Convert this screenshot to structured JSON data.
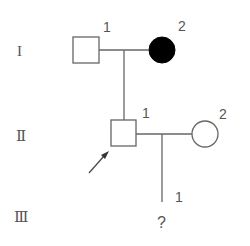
{
  "diagram": {
    "type": "pedigree-chart",
    "colors": {
      "line": "#666666",
      "affected_fill": "#000000",
      "unaffected_fill": "#ffffff",
      "text": "#555555"
    },
    "generations": [
      {
        "label": "I",
        "y": 50
      },
      {
        "label": "Ⅱ",
        "y": 135
      },
      {
        "label": "Ⅲ",
        "y": 216
      }
    ],
    "individuals": [
      {
        "id": "I-1",
        "generation": "I",
        "number": "1",
        "sex": "male",
        "affected": false
      },
      {
        "id": "I-2",
        "generation": "I",
        "number": "2",
        "sex": "female",
        "affected": true
      },
      {
        "id": "II-1",
        "generation": "II",
        "number": "1",
        "sex": "male",
        "affected": false,
        "proband": true
      },
      {
        "id": "II-2",
        "generation": "II",
        "number": "2",
        "sex": "female",
        "affected": false
      },
      {
        "id": "III-1",
        "generation": "III",
        "number": "1",
        "sex": "unknown",
        "status": "?"
      }
    ],
    "proband_arrow": {
      "points_to": "II-1"
    }
  }
}
